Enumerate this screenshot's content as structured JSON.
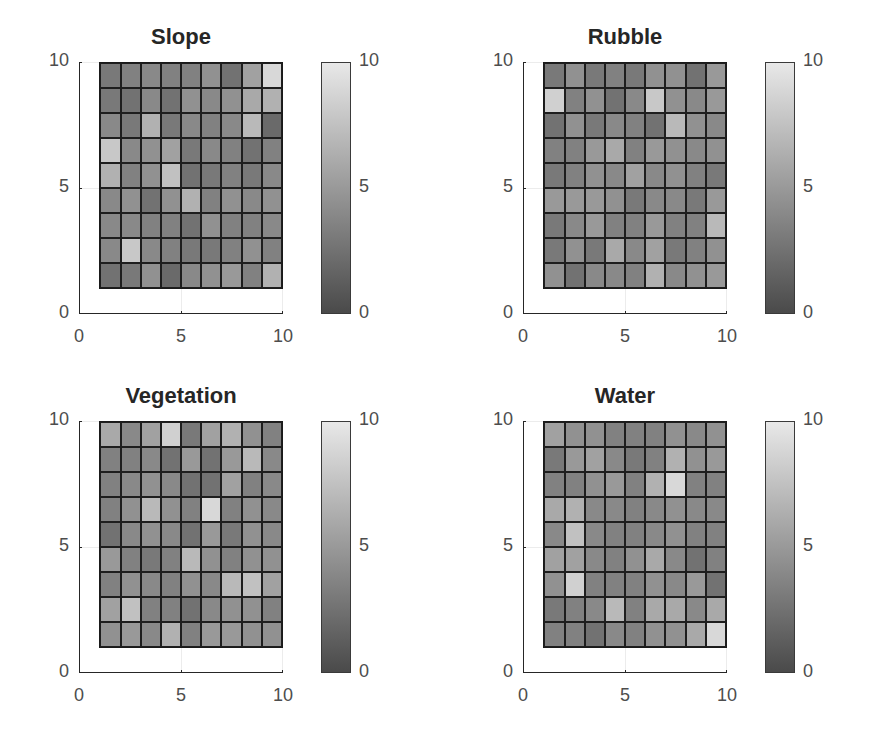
{
  "chart_data": [
    {
      "type": "heatmap",
      "title": "Slope",
      "x_ticks": [
        "0",
        "5",
        "10"
      ],
      "y_ticks": [
        "0",
        "5",
        "10"
      ],
      "xlim": [
        0,
        10
      ],
      "ylim": [
        0,
        10
      ],
      "colorbar": {
        "ticks": [
          "0",
          "5",
          "10"
        ],
        "range": [
          0,
          10
        ],
        "colormap": "gray"
      },
      "grid": true,
      "rows_top_to_bottom": [
        [
          3,
          3.5,
          4,
          3.5,
          3.5,
          4.5,
          2.5,
          5.5,
          9
        ],
        [
          3,
          2.5,
          4,
          2.5,
          4.5,
          4,
          4.5,
          6,
          6.5
        ],
        [
          4,
          3,
          6.5,
          3,
          4,
          3.5,
          4,
          7,
          2
        ],
        [
          8,
          4,
          4.5,
          5.5,
          3,
          4,
          3.5,
          2.5,
          3.5
        ],
        [
          6.5,
          3.5,
          4.5,
          7.5,
          2.5,
          3,
          3.5,
          3,
          4
        ],
        [
          4,
          4.5,
          2.5,
          4.5,
          6.5,
          3.5,
          4.5,
          4,
          4.5
        ],
        [
          4,
          4,
          3.5,
          3.5,
          2.5,
          4.5,
          3.5,
          3.5,
          4
        ],
        [
          4,
          8,
          4,
          3.5,
          3,
          3,
          3.5,
          4.5,
          3.5
        ],
        [
          2.5,
          3,
          4.5,
          2,
          4,
          4.5,
          5,
          3.5,
          6.5
        ]
      ]
    },
    {
      "type": "heatmap",
      "title": "Rubble",
      "x_ticks": [
        "0",
        "5",
        "10"
      ],
      "y_ticks": [
        "0",
        "5",
        "10"
      ],
      "xlim": [
        0,
        10
      ],
      "ylim": [
        0,
        10
      ],
      "colorbar": {
        "ticks": [
          "0",
          "5",
          "10"
        ],
        "range": [
          0,
          10
        ],
        "colormap": "gray"
      },
      "grid": true,
      "rows_top_to_bottom": [
        [
          3,
          4.5,
          3,
          3.5,
          3,
          4.5,
          4.5,
          2.5,
          5
        ],
        [
          8.5,
          3.5,
          4.5,
          2.5,
          4,
          8,
          4.5,
          4,
          5
        ],
        [
          2.5,
          4.5,
          3,
          4,
          3.5,
          2.5,
          7,
          4.5,
          4
        ],
        [
          3.5,
          3.5,
          5,
          6,
          3.5,
          5,
          4.5,
          4,
          4.5
        ],
        [
          3,
          3.5,
          4.5,
          4,
          5.5,
          4,
          4.5,
          3.5,
          3
        ],
        [
          5,
          5,
          5,
          4.5,
          3,
          4,
          4,
          3,
          5
        ],
        [
          3,
          4,
          5,
          3.5,
          3.5,
          5,
          3.5,
          3.5,
          7
        ],
        [
          3,
          4.5,
          3,
          6,
          4,
          5.5,
          3,
          3.5,
          4.5
        ],
        [
          4.5,
          2.5,
          4,
          4,
          3.5,
          6.5,
          4,
          4.5,
          5
        ]
      ]
    },
    {
      "type": "heatmap",
      "title": "Vegetation",
      "x_ticks": [
        "0",
        "5",
        "10"
      ],
      "y_ticks": [
        "0",
        "5",
        "10"
      ],
      "xlim": [
        0,
        10
      ],
      "ylim": [
        0,
        10
      ],
      "colorbar": {
        "ticks": [
          "0",
          "5",
          "10"
        ],
        "range": [
          0,
          10
        ],
        "colormap": "gray"
      },
      "grid": true,
      "rows_top_to_bottom": [
        [
          6,
          4,
          5.5,
          8.5,
          3,
          5.5,
          6.5,
          4.5,
          3.5
        ],
        [
          3.5,
          3.5,
          4,
          2.5,
          5,
          2.5,
          5,
          7,
          4
        ],
        [
          3.5,
          4,
          4.5,
          4,
          2.5,
          2.5,
          5.5,
          3.5,
          4
        ],
        [
          3.5,
          4.5,
          7,
          4.5,
          3.5,
          9,
          3.5,
          4.5,
          4
        ],
        [
          2.5,
          4,
          4.5,
          4,
          2.5,
          5,
          3,
          4.5,
          4
        ],
        [
          5,
          3.5,
          3,
          3.5,
          7,
          4.5,
          3.5,
          4.5,
          4.5
        ],
        [
          3.5,
          4.5,
          4,
          3.5,
          4.5,
          4,
          7,
          7.5,
          5.5
        ],
        [
          5.5,
          7.5,
          3.5,
          3.5,
          2.5,
          4,
          4.5,
          4.5,
          3.5
        ],
        [
          4.5,
          5,
          4,
          6.5,
          3.5,
          5,
          5,
          4.5,
          4.5
        ]
      ]
    },
    {
      "type": "heatmap",
      "title": "Water",
      "x_ticks": [
        "0",
        "5",
        "10"
      ],
      "y_ticks": [
        "0",
        "5",
        "10"
      ],
      "xlim": [
        0,
        10
      ],
      "ylim": [
        0,
        10
      ],
      "colorbar": {
        "ticks": [
          "0",
          "5",
          "10"
        ],
        "range": [
          0,
          10
        ],
        "colormap": "gray"
      },
      "grid": true,
      "rows_top_to_bottom": [
        [
          5.5,
          4.5,
          4.5,
          3.5,
          3.5,
          3.5,
          4.5,
          4,
          4.5
        ],
        [
          3,
          5,
          5.5,
          4,
          3,
          3.5,
          6.5,
          4.5,
          5
        ],
        [
          3.5,
          3.5,
          4.5,
          5,
          3.5,
          6.5,
          9,
          3.5,
          3.5
        ],
        [
          6,
          6.5,
          4,
          4,
          3.5,
          4,
          4.5,
          4,
          4
        ],
        [
          4,
          7.5,
          4,
          3.5,
          3.5,
          4,
          4.5,
          3.5,
          3.5
        ],
        [
          5.5,
          5.5,
          4,
          3.5,
          4.5,
          6,
          4,
          2.5,
          3.5
        ],
        [
          4.5,
          8.5,
          3.5,
          3.5,
          3.5,
          4.5,
          4,
          5,
          2.5
        ],
        [
          3,
          3.5,
          4,
          7,
          3.5,
          6,
          6,
          4,
          6
        ],
        [
          3.5,
          3.5,
          2.5,
          4,
          3.5,
          4.5,
          4.5,
          6,
          9
        ]
      ]
    }
  ],
  "panels": [
    {
      "title": "Slope"
    },
    {
      "title": "Rubble"
    },
    {
      "title": "Vegetation"
    },
    {
      "title": "Water"
    }
  ],
  "axis": {
    "x_ticks": [
      "0",
      "5",
      "10"
    ],
    "y_ticks": [
      "0",
      "5",
      "10"
    ],
    "cbar_ticks": [
      "0",
      "5",
      "10"
    ]
  },
  "colors": {
    "cmap_low": "#4a4a4a",
    "cmap_high": "#e8e8e8",
    "axis": "#262626",
    "tick_label": "#4d4d4d"
  }
}
